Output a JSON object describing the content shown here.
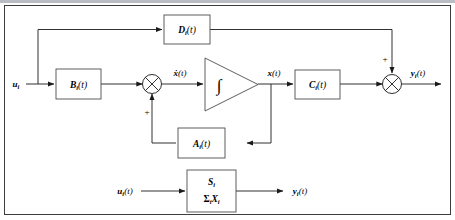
{
  "figure": {
    "type": "state-space-block-diagram",
    "title": "",
    "frame_visible": true
  },
  "blocks": {
    "d_block": {
      "name": "D-matrix-block",
      "base": "D",
      "subscript": "i",
      "arg": "(t)",
      "label": "Dᵢ(t)"
    },
    "b_block": {
      "name": "B-matrix-block",
      "base": "B",
      "subscript": "i",
      "arg": "(t)",
      "label": "Bᵢ(t)"
    },
    "a_block": {
      "name": "A-matrix-block",
      "base": "A",
      "subscript": "i",
      "arg": "(t)",
      "label": "Aᵢ(t)"
    },
    "c_block": {
      "name": "C-matrix-block",
      "base": "C",
      "subscript": "i",
      "arg": "(t)",
      "label": "Cᵢ(t)"
    },
    "integrator": {
      "name": "integrator-block",
      "glyph": "∫",
      "shape": "triangle"
    },
    "system_block": {
      "name": "subsystem-block",
      "line1_base": "S",
      "line1_sub": "i",
      "line2_sigma": "Σ",
      "line2_sigma_sub": "i",
      "line2_base": "X",
      "line2_sub": "i",
      "label": "Sᵢ / ΣᵢXᵢ"
    }
  },
  "junctions": {
    "input_sum": {
      "name": "input-summing-junction",
      "sign": "+",
      "sign_position": "below"
    },
    "output_sum": {
      "name": "output-summing-junction",
      "sign": "+",
      "sign_position": "above"
    }
  },
  "signals": {
    "u_input": {
      "base": "u",
      "subscript": "i",
      "arg": "",
      "label": "uᵢ"
    },
    "xdot": {
      "base": "ẋ",
      "subscript": "",
      "arg": "(t)",
      "label": "ẋ(t)"
    },
    "x_state": {
      "base": "x",
      "subscript": "",
      "arg": "(t)",
      "label": "x(t)"
    },
    "y_output": {
      "base": "y",
      "subscript": "i",
      "arg": "(t)",
      "label": "yᵢ(t)"
    },
    "u_lower": {
      "base": "u",
      "subscript": "i",
      "arg": "(t)",
      "label": "uᵢ(t)"
    },
    "y_lower": {
      "base": "y",
      "subscript": "i",
      "arg": "(t)",
      "label": "yᵢ(t)"
    }
  },
  "colors": {
    "wire": "#1a1a1a",
    "box_stroke": "#4d4d4d",
    "frame_stroke": "#3d3d3d",
    "background": "#ffffff",
    "topbar": "#b9bcc2"
  }
}
